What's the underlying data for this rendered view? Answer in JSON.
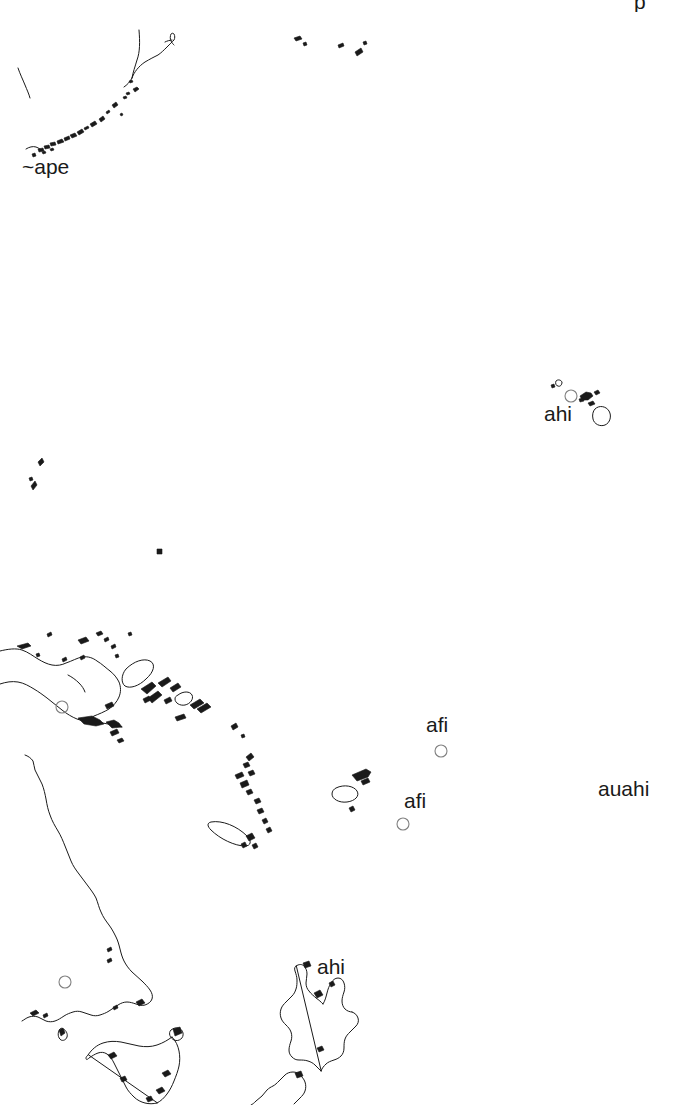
{
  "map": {
    "title": "Pacific Region Outline Map",
    "background_color": "#ffffff",
    "coastline_color": "#1a1a1a",
    "marker_color": "#808080",
    "label_color": "#1a1a1a",
    "width": 680,
    "height": 1105,
    "labels": [
      {
        "id": "label-ape",
        "text": "~ape",
        "x": 22,
        "y": 156,
        "font_size": 21
      },
      {
        "id": "label-ahi-hawaii",
        "text": "ahi",
        "x": 544,
        "y": 403,
        "font_size": 21
      },
      {
        "id": "label-afi-upper",
        "text": "afi",
        "x": 426,
        "y": 714,
        "font_size": 21
      },
      {
        "id": "label-afi-lower",
        "text": "afi",
        "x": 404,
        "y": 790,
        "font_size": 21
      },
      {
        "id": "label-auahi",
        "text": "auahi",
        "x": 598,
        "y": 778,
        "font_size": 21
      },
      {
        "id": "label-ahi-nz",
        "text": "ahi",
        "x": 317,
        "y": 956,
        "font_size": 21
      }
    ],
    "clipped_label": {
      "id": "label-top-clipped",
      "text": "p",
      "x": 634,
      "y": -9,
      "font_size": 21
    },
    "markers": [
      {
        "id": "marker-hawaii",
        "x": 571,
        "y": 396,
        "r": 6
      },
      {
        "id": "marker-samoa",
        "x": 441,
        "y": 751,
        "r": 6
      },
      {
        "id": "marker-tonga",
        "x": 403,
        "y": 824,
        "r": 6
      },
      {
        "id": "marker-newguinea",
        "x": 62,
        "y": 707,
        "r": 6
      },
      {
        "id": "marker-australia",
        "x": 65,
        "y": 982,
        "r": 6
      }
    ],
    "regions": [
      "japan-ryukyu-arc",
      "bonin-mariana-specks",
      "hawaiian-islands",
      "palau-caroline-specks",
      "mid-pacific-dot",
      "new-guinea",
      "bismarck-archipelago",
      "solomon-islands",
      "vanuatu",
      "new-caledonia",
      "fiji",
      "australia-east-coast",
      "tasmania",
      "new-zealand"
    ]
  }
}
